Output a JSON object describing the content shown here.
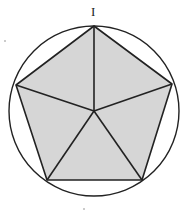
{
  "diagram": {
    "vertex_label": "I",
    "colors": {
      "fill": "#d6d6d6",
      "stroke": "#222222",
      "background": "#ffffff"
    },
    "circle": {
      "cx": 94,
      "cy": 111,
      "r": 85
    },
    "center": {
      "x": 94,
      "y": 111
    },
    "vertices": [
      {
        "x": 94,
        "y": 26
      },
      {
        "x": 172,
        "y": 84
      },
      {
        "x": 142,
        "y": 180
      },
      {
        "x": 47,
        "y": 180
      },
      {
        "x": 16,
        "y": 85
      }
    ]
  }
}
